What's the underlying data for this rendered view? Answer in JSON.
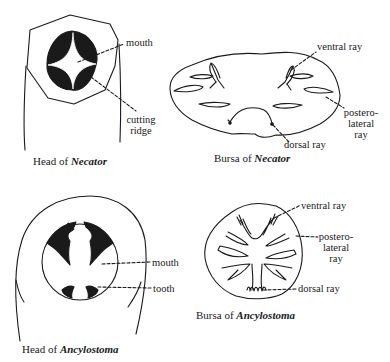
{
  "figures": {
    "head_necator": {
      "caption_prefix": "Head of ",
      "caption_genus": "Necator",
      "labels": {
        "mouth": "mouth",
        "cutting_ridge_1": "cutting",
        "cutting_ridge_2": "ridge"
      }
    },
    "bursa_necator": {
      "caption_prefix": "Bursa of ",
      "caption_genus": "Necator",
      "labels": {
        "ventral_ray": "ventral ray",
        "postero_1": "postero-",
        "postero_2": "lateral",
        "postero_3": "ray",
        "dorsal_ray": "dorsal ray"
      }
    },
    "head_ancylostoma": {
      "caption_prefix": "Head of ",
      "caption_genus": "Ancylostoma",
      "labels": {
        "mouth": "mouth",
        "tooth": "tooth"
      }
    },
    "bursa_ancylostoma": {
      "caption_prefix": "Bursa of ",
      "caption_genus": "Ancylostoma",
      "labels": {
        "ventral_ray": "ventral ray",
        "postero_1": "postero-",
        "postero_2": "lateral",
        "postero_3": "ray",
        "dorsal_ray": "dorsal ray"
      }
    }
  },
  "colors": {
    "ink": "#1a1a1a",
    "background": "#ffffff"
  }
}
